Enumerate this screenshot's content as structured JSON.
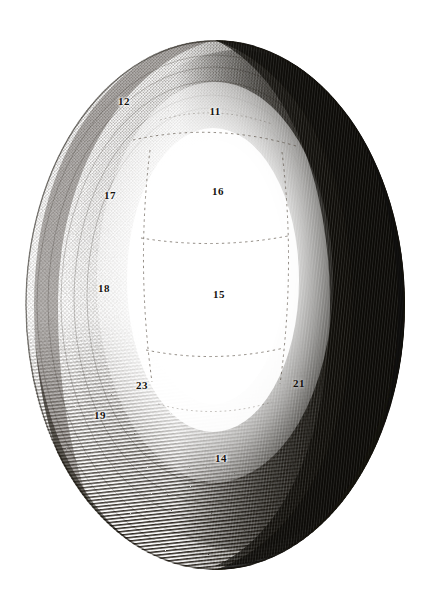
{
  "plate": {
    "title": "Anatomical engraving plate",
    "subject": "Ovoid specimen, dorsal aspect",
    "technique": "Stipple and line engraving",
    "background_color": "#ffffff",
    "ink_color": "#15120e",
    "canvas": {
      "width": 443,
      "height": 608
    }
  },
  "figure": {
    "name": "ovoid-specimen",
    "outline": {
      "center_x": 215,
      "center_y": 305,
      "radius_x": 190,
      "radius_y": 265
    },
    "light_source": "upper-left",
    "shadow_side": "right",
    "highlight_region": {
      "center_x": 215,
      "center_y": 280,
      "radius_x": 78,
      "radius_y": 150
    }
  },
  "reference_numbers": [
    {
      "id": "label-12",
      "text": "12",
      "x": 124,
      "y": 101,
      "tone": "light"
    },
    {
      "id": "label-11",
      "text": "11",
      "x": 215,
      "y": 111,
      "tone": "light"
    },
    {
      "id": "label-17",
      "text": "17",
      "x": 110,
      "y": 195,
      "tone": "light"
    },
    {
      "id": "label-16",
      "text": "16",
      "x": 218,
      "y": 191,
      "tone": "light"
    },
    {
      "id": "label-18",
      "text": "18",
      "x": 104,
      "y": 288,
      "tone": "light"
    },
    {
      "id": "label-15",
      "text": "15",
      "x": 219,
      "y": 294,
      "tone": "light"
    },
    {
      "id": "label-23",
      "text": "23",
      "x": 142,
      "y": 385,
      "tone": "light"
    },
    {
      "id": "label-21",
      "text": "21",
      "x": 299,
      "y": 383,
      "tone": "dark"
    },
    {
      "id": "label-19",
      "text": "19",
      "x": 100,
      "y": 415,
      "tone": "light"
    },
    {
      "id": "label-14",
      "text": "14",
      "x": 221,
      "y": 458,
      "tone": "light"
    }
  ]
}
